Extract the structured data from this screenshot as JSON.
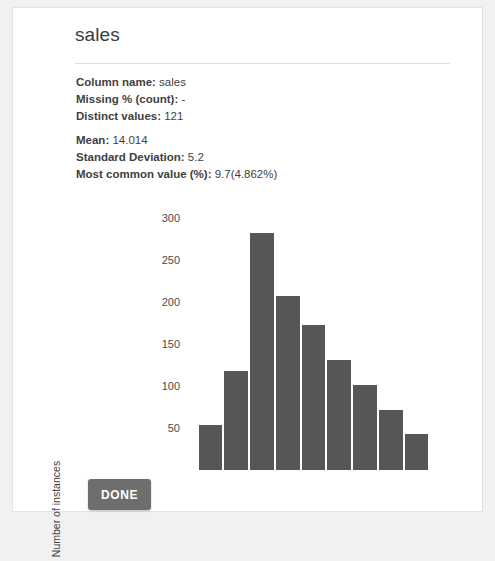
{
  "dialog": {
    "title": "sales",
    "done_label": "DONE"
  },
  "stats": [
    {
      "label": "Column name:",
      "value": "sales"
    },
    {
      "label": "Missing % (count):",
      "value": "-"
    },
    {
      "label": "Distinct values:",
      "value": "121"
    },
    {
      "label": "Mean:",
      "value": "14.014"
    },
    {
      "label": "Standard Deviation:",
      "value": "5.2"
    },
    {
      "label": "Most common value (%):",
      "value": "9.7(4.862%)"
    }
  ],
  "chart_data": {
    "type": "bar",
    "title": "",
    "xlabel": "",
    "ylabel": "Number of instances",
    "categories": [
      "1",
      "2",
      "3",
      "4",
      "5",
      "6",
      "7",
      "8",
      "9"
    ],
    "values": [
      53,
      118,
      282,
      207,
      173,
      131,
      101,
      72,
      43
    ],
    "yticks": [
      50,
      100,
      150,
      200,
      250,
      300
    ],
    "ylim": [
      0,
      310
    ],
    "grid": false,
    "legend": false,
    "bar_color": "#565656"
  },
  "colors": {
    "page_background": "#f1f1f1",
    "card_background": "#ffffff",
    "bar": "#565656",
    "button": "#6e6e6e",
    "text": "#3f3f3f"
  }
}
